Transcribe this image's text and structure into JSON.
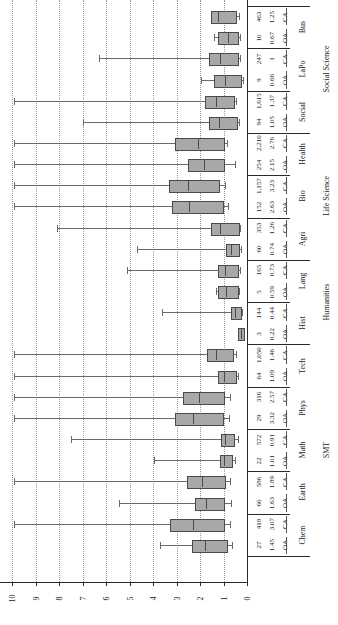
{
  "chart_data": {
    "type": "box",
    "title": "",
    "xlabel": "",
    "ylabel": "",
    "orientation": "horizontal-rotated",
    "axis": {
      "ticks": [
        "0",
        "1",
        "2",
        "3",
        "4",
        "5",
        "6",
        "7",
        "8",
        "9",
        "10"
      ],
      "min": 0,
      "max": 10,
      "grid": true
    },
    "columns": {
      "n_header": "n",
      "median_header": "median",
      "access_header": "access"
    },
    "groups": [
      {
        "label": "Social Science",
        "disciplines": [
          "Bus",
          "LaPo",
          "Social"
        ]
      },
      {
        "label": "Life Science",
        "disciplines": [
          "Health",
          "Bio",
          "Agri"
        ]
      },
      {
        "label": "Humanities",
        "disciplines": [
          "Lang",
          "Hist"
        ]
      },
      {
        "label": "SMT",
        "disciplines": [
          "Tech",
          "Phys",
          "Math",
          "Earth",
          "Chem"
        ]
      }
    ],
    "rows": [
      {
        "group": "Social Science",
        "discipline": "Bus",
        "access": "CA",
        "n": "463",
        "value": "1.25",
        "whisker_low": 1.08,
        "q1": 1.55,
        "median": 1.25,
        "q3": 0.52,
        "whisker_high": 0.35
      },
      {
        "group": "Social Science",
        "discipline": "Bus",
        "access": "OA",
        "n": "10",
        "value": "0.67",
        "whisker_low": 1.42,
        "q1": 1.22,
        "median": 0.8,
        "q3": 0.42,
        "whisker_high": 0.3
      },
      {
        "group": "Social Science",
        "discipline": "LaPo",
        "access": "CA",
        "n": "247",
        "value": "1",
        "whisker_low": 6.3,
        "q1": 1.62,
        "median": 1.15,
        "q3": 0.44,
        "whisker_high": 0.3
      },
      {
        "group": "Social Science",
        "discipline": "LaPo",
        "access": "OA",
        "n": "9",
        "value": "0.66",
        "whisker_low": 1.95,
        "q1": 1.4,
        "median": 0.92,
        "q3": 0.3,
        "whisker_high": 0.18
      },
      {
        "group": "Social Science",
        "discipline": "Social",
        "access": "CA",
        "n": "1,615",
        "value": "1.37",
        "whisker_low": 9.9,
        "q1": 1.77,
        "median": 1.3,
        "q3": 0.6,
        "whisker_high": 0.45
      },
      {
        "group": "Social Science",
        "discipline": "Social",
        "access": "OA",
        "n": "94",
        "value": "1.05",
        "whisker_low": 7.0,
        "q1": 1.62,
        "median": 1.2,
        "q3": 0.45,
        "whisker_high": 0.32
      },
      {
        "group": "Life Science",
        "discipline": "Health",
        "access": "CA",
        "n": "2,210",
        "value": "2.76",
        "whisker_low": 9.9,
        "q1": 3.08,
        "median": 2.1,
        "q3": 1.04,
        "whisker_high": 0.85
      },
      {
        "group": "Life Science",
        "discipline": "Health",
        "access": "OA",
        "n": "254",
        "value": "2.15",
        "whisker_low": 9.9,
        "q1": 2.52,
        "median": 1.85,
        "q3": 1.0,
        "whisker_high": 0.52
      },
      {
        "group": "Life Science",
        "discipline": "Bio",
        "access": "CA",
        "n": "1,157",
        "value": "3.23",
        "whisker_low": 9.9,
        "q1": 3.3,
        "median": 2.5,
        "q3": 1.22,
        "whisker_high": 0.95
      },
      {
        "group": "Life Science",
        "discipline": "Bio",
        "access": "OA",
        "n": "152",
        "value": "2.63",
        "whisker_low": 9.9,
        "q1": 3.2,
        "median": 2.45,
        "q3": 1.05,
        "whisker_high": 0.8
      },
      {
        "group": "Life Science",
        "discipline": "Agri",
        "access": "CA",
        "n": "353",
        "value": "1.26",
        "whisker_low": 8.1,
        "q1": 1.55,
        "median": 1.15,
        "q3": 0.4,
        "whisker_high": 0.28
      },
      {
        "group": "Life Science",
        "discipline": "Agri",
        "access": "OA",
        "n": "60",
        "value": "0.74",
        "whisker_low": 4.7,
        "q1": 0.88,
        "median": 0.7,
        "q3": 0.4,
        "whisker_high": 0.25
      },
      {
        "group": "Humanities",
        "discipline": "Lang",
        "access": "CA",
        "n": "165",
        "value": "0.73",
        "whisker_low": 5.1,
        "q1": 1.22,
        "median": 0.92,
        "q3": 0.42,
        "whisker_high": 0.28
      },
      {
        "group": "Humanities",
        "discipline": "Lang",
        "access": "OA",
        "n": "5",
        "value": "0.59",
        "whisker_low": 1.3,
        "q1": 1.22,
        "median": 0.9,
        "q3": 0.44,
        "whisker_high": 0.36
      },
      {
        "group": "Humanities",
        "discipline": "Hist",
        "access": "CA",
        "n": "144",
        "value": "0.44",
        "whisker_low": 3.6,
        "q1": 0.7,
        "median": 0.52,
        "q3": 0.3,
        "whisker_high": 0.2
      },
      {
        "group": "Humanities",
        "discipline": "Hist",
        "access": "OA",
        "n": "3",
        "value": "0.22",
        "whisker_low": 0.4,
        "q1": 0.38,
        "median": 0.26,
        "q3": 0.16,
        "whisker_high": 0.12
      },
      {
        "group": "SMT",
        "discipline": "Tech",
        "access": "CA",
        "n": "1,050",
        "value": "1.46",
        "whisker_low": 9.9,
        "q1": 1.72,
        "median": 1.3,
        "q3": 0.62,
        "whisker_high": 0.48
      },
      {
        "group": "SMT",
        "discipline": "Tech",
        "access": "OA",
        "n": "64",
        "value": "1.09",
        "whisker_low": 9.9,
        "q1": 1.22,
        "median": 0.98,
        "q3": 0.52,
        "whisker_high": 0.38
      },
      {
        "group": "SMT",
        "discipline": "Phys",
        "access": "CA",
        "n": "316",
        "value": "2.57",
        "whisker_low": 9.9,
        "q1": 2.72,
        "median": 2.05,
        "q3": 1.02,
        "whisker_high": 0.72
      },
      {
        "group": "SMT",
        "discipline": "Phys",
        "access": "OA",
        "n": "29",
        "value": "3.32",
        "whisker_low": 9.9,
        "q1": 3.05,
        "median": 2.28,
        "q3": 1.05,
        "whisker_high": 0.78
      },
      {
        "group": "SMT",
        "discipline": "Math",
        "access": "CA",
        "n": "572",
        "value": "0.91",
        "whisker_low": 7.5,
        "q1": 1.12,
        "median": 0.92,
        "q3": 0.6,
        "whisker_high": 0.38
      },
      {
        "group": "SMT",
        "discipline": "Math",
        "access": "OA",
        "n": "22",
        "value": "1.01",
        "whisker_low": 3.95,
        "q1": 1.15,
        "median": 0.98,
        "q3": 0.68,
        "whisker_high": 0.5
      },
      {
        "group": "SMT",
        "discipline": "Earth",
        "access": "CA",
        "n": "586",
        "value": "1.89",
        "whisker_low": 9.9,
        "q1": 2.55,
        "median": 1.9,
        "q3": 0.98,
        "whisker_high": 0.72
      },
      {
        "group": "SMT",
        "discipline": "Earth",
        "access": "OA",
        "n": "66",
        "value": "1.63",
        "whisker_low": 5.45,
        "q1": 2.22,
        "median": 1.75,
        "q3": 1.0,
        "whisker_high": 0.68
      },
      {
        "group": "SMT",
        "discipline": "Chem",
        "access": "CA",
        "n": "418",
        "value": "3.07",
        "whisker_low": 9.9,
        "q1": 3.28,
        "median": 2.3,
        "q3": 1.0,
        "whisker_high": 0.72
      },
      {
        "group": "SMT",
        "discipline": "Chem",
        "access": "OA",
        "n": "27",
        "value": "1.45",
        "whisker_low": 3.72,
        "q1": 2.35,
        "median": 1.78,
        "q3": 0.88,
        "whisker_high": 0.62
      }
    ]
  }
}
